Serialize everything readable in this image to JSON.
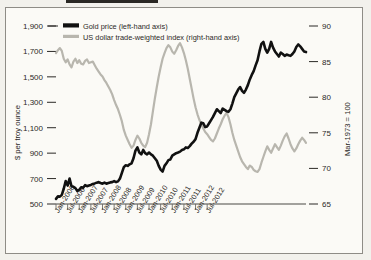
{
  "chart_data": {
    "type": "line",
    "title": "",
    "xlabel": "",
    "ylabel": "$ per troy ounce",
    "y2label": "Mar-1973 = 100",
    "grid": false,
    "legend_position": "top-left",
    "ylim": [
      500,
      1900
    ],
    "y2lim": [
      65,
      90
    ],
    "yticks": [
      "1,900",
      "1,700",
      "1,500",
      "1,300",
      "1,100",
      "900",
      "700",
      "500"
    ],
    "ytick_values": [
      1900,
      1700,
      1500,
      1300,
      1100,
      900,
      700,
      500
    ],
    "y2ticks": [
      "90",
      "85",
      "80",
      "75",
      "70",
      "65"
    ],
    "y2tick_values": [
      90,
      85,
      80,
      75,
      70,
      65
    ],
    "xticks": [
      "Jan-2006",
      "Jul-2006",
      "Jan-2007",
      "Jul-2007",
      "Jan-2008",
      "Jul-2008",
      "Jan-2009",
      "Jul-2009",
      "Jan-2010",
      "Jul-2010",
      "Jan-2011",
      "Jul-2011",
      "Jan-2012",
      "Jul-2012"
    ],
    "xlim": [
      "Jan-2006",
      "Oct-2012"
    ],
    "series": [
      {
        "name": "Gold price (left-hand axis)",
        "axis": "left",
        "color": "#111111",
        "width": 2.6,
        "values": [
          540,
          560,
          558,
          572,
          620,
          680,
          645,
          700,
          640,
          635,
          625,
          602,
          612,
          632,
          628,
          648,
          640,
          645,
          650,
          658,
          662,
          668,
          672,
          665,
          660,
          668,
          660,
          665,
          670,
          672,
          680,
          672,
          678,
          700,
          745,
          790,
          805,
          800,
          812,
          820,
          860,
          920,
          945,
          905,
          890,
          925,
          900,
          890,
          905,
          890,
          880,
          860,
          840,
          800,
          770,
          755,
          800,
          820,
          845,
          850,
          880,
          890,
          900,
          905,
          912,
          925,
          930,
          945,
          940,
          955,
          975,
          990,
          1010,
          1060,
          1100,
          1140,
          1135,
          1105,
          1110,
          1135,
          1160,
          1185,
          1215,
          1245,
          1230,
          1215,
          1250,
          1240,
          1230,
          1225,
          1245,
          1290,
          1340,
          1370,
          1400,
          1420,
          1390,
          1375,
          1400,
          1435,
          1480,
          1515,
          1545,
          1590,
          1630,
          1700,
          1760,
          1775,
          1720,
          1690,
          1720,
          1775,
          1730,
          1700,
          1680,
          1660,
          1690,
          1680,
          1665,
          1675,
          1670,
          1665,
          1680,
          1700,
          1735,
          1755,
          1740,
          1720,
          1700,
          1695
        ]
      },
      {
        "name": "US dollar trade-weighted index (right-hand axis)",
        "axis": "right",
        "color": "#b8b6ae",
        "width": 2.2,
        "values": [
          86.2,
          86.6,
          86.9,
          86.5,
          85.4,
          84.9,
          85.3,
          84.6,
          84.2,
          85.0,
          85.4,
          84.8,
          85.2,
          84.7,
          84.6,
          85.1,
          85.3,
          84.8,
          84.9,
          85.0,
          84.5,
          84.0,
          83.6,
          83.2,
          82.9,
          82.4,
          82.0,
          81.5,
          81.0,
          80.4,
          79.6,
          78.9,
          78.3,
          77.5,
          76.6,
          75.4,
          74.6,
          74.0,
          73.4,
          72.9,
          73.2,
          74.0,
          74.6,
          74.2,
          73.6,
          73.2,
          73.0,
          73.6,
          74.8,
          76.2,
          78.0,
          79.8,
          81.4,
          82.9,
          84.2,
          85.4,
          86.2,
          86.9,
          87.3,
          87.0,
          86.4,
          86.1,
          86.6,
          87.2,
          87.6,
          87.0,
          86.2,
          85.2,
          84.0,
          82.6,
          81.2,
          79.8,
          78.6,
          77.6,
          76.8,
          76.2,
          75.6,
          75.1,
          74.8,
          74.4,
          74.0,
          73.8,
          74.2,
          74.9,
          75.6,
          76.2,
          76.9,
          77.4,
          77.8,
          77.2,
          76.2,
          75.0,
          74.0,
          73.2,
          72.4,
          71.6,
          71.0,
          70.6,
          70.2,
          69.9,
          70.4,
          70.2,
          69.8,
          69.6,
          69.5,
          69.9,
          70.8,
          71.6,
          72.4,
          73.1,
          72.6,
          72.2,
          72.8,
          73.4,
          73.0,
          72.6,
          73.2,
          73.9,
          74.5,
          74.9,
          74.2,
          73.4,
          72.8,
          72.4,
          72.8,
          73.4,
          73.9,
          74.3,
          74.0,
          73.6
        ]
      }
    ]
  },
  "legend": {
    "items": [
      {
        "label": "Gold price (left-hand axis)",
        "color": "#111111"
      },
      {
        "label": "US dollar trade-weighted index (right-hand axis)",
        "color": "#b8b6ae"
      }
    ]
  },
  "axes": {
    "left_title": "$ per troy ounce",
    "right_title": "Mar-1973 = 100"
  }
}
